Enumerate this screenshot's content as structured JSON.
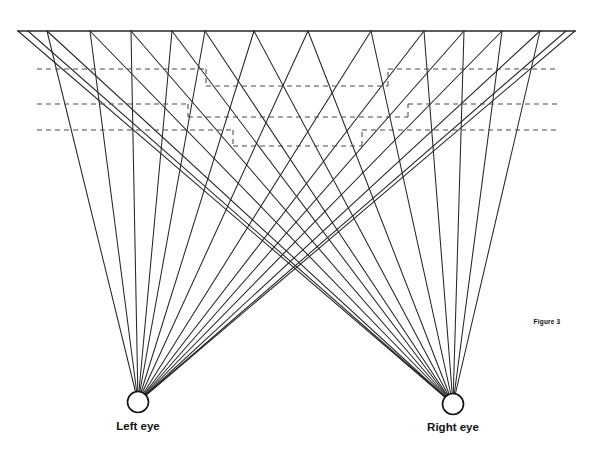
{
  "figure": {
    "caption": "Figure 3",
    "type": "stereo-ray-geometry-diagram",
    "background_color": "#ffffff",
    "line_color": "#262626",
    "dashed_color": "#4a4a4a"
  },
  "labels": {
    "left_eye": "Left eye",
    "right_eye": "Right eye"
  },
  "geometry": {
    "canvas": {
      "width": 592,
      "height": 455
    },
    "screen_line": {
      "x1": 18,
      "y1": 31,
      "x2": 575,
      "y2": 31,
      "stroke_width": 1.6
    },
    "left_eye": {
      "cx": 138,
      "cy": 402,
      "r": 10.5
    },
    "right_eye": {
      "cx": 453,
      "cy": 404,
      "r": 10.5
    },
    "left_eye_label_pos": {
      "x": 138,
      "y": 430
    },
    "right_eye_label_pos": {
      "x": 453,
      "y": 431
    },
    "caption_pos": {
      "x": 547,
      "y": 324
    },
    "left_ray_top_x": [
      47,
      90,
      131,
      172,
      205,
      254,
      308,
      371,
      424,
      464,
      502,
      540,
      566,
      575
    ],
    "right_ray_top_x": [
      18,
      28,
      47,
      90,
      131,
      172,
      205,
      254,
      308,
      371,
      424,
      464,
      502,
      540
    ],
    "dashed_levels_y": [
      69,
      104,
      130
    ],
    "dashed_step_y": [
      86,
      117,
      146
    ],
    "dashed_left_start_x": 37,
    "dashed_right_end_x": 557,
    "staircase_steps": [
      {
        "level": 0,
        "plateau_y": 69,
        "step_y": 86,
        "inner_left_x": 206,
        "inner_right_x": 388
      },
      {
        "level": 1,
        "plateau_y": 104,
        "step_y": 117,
        "inner_left_x": 188,
        "inner_right_x": 408
      },
      {
        "level": 2,
        "plateau_y": 130,
        "step_y": 146,
        "inner_left_x": 233,
        "inner_right_x": 362
      }
    ]
  },
  "chart_data": {
    "type": "line",
    "title": "Figure 3",
    "xlabel": "",
    "ylabel": "",
    "series": [
      {
        "name": "Left eye rays",
        "count": 14
      },
      {
        "name": "Right eye rays",
        "count": 14
      },
      {
        "name": "Dashed depth contours",
        "count": 3
      }
    ]
  }
}
